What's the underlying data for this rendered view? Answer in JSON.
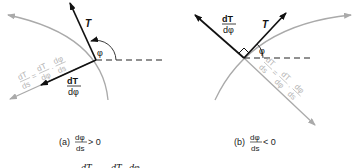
{
  "panel_a": {
    "tangent_label": "T",
    "angle_label": "φ",
    "dTdphi_num": "dT",
    "dTdphi_den": "dφ",
    "chain_lhs_num": "dT",
    "chain_lhs_den": "ds",
    "chain_eq": "=",
    "chain_r1_num": "dT",
    "chain_r1_den": "dφ",
    "chain_dot": "·",
    "chain_r2_num": "dφ",
    "chain_r2_den": "ds",
    "caption_prefix": "(a)",
    "caption_num": "dφ",
    "caption_den": "ds",
    "caption_rel": "> 0"
  },
  "panel_b": {
    "tangent_label": "T",
    "angle_label": "φ",
    "dTdphi_num": "dT",
    "dTdphi_den": "dφ",
    "chain_lhs_num": "dT",
    "chain_lhs_den": "ds",
    "chain_eq": "=",
    "chain_r1_num": "dT",
    "chain_r1_den": "dφ",
    "chain_dot": "·",
    "chain_r2_num": "dφ",
    "chain_r2_den": "ds",
    "caption_prefix": "(b)",
    "caption_num": "dφ",
    "caption_den": "ds",
    "caption_rel": "< 0"
  },
  "bottom_equation": {
    "lhs": "dT",
    "rhs1": "dT",
    "rhs2": "dφ"
  },
  "colors": {
    "primary": "#111111",
    "gray": "#aaaaaa",
    "gray_text": "#b5b5b5"
  }
}
